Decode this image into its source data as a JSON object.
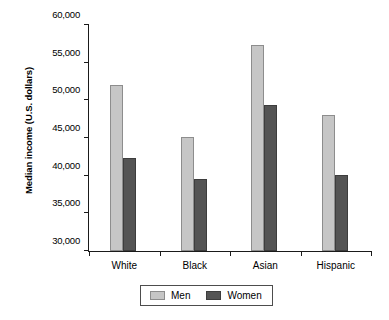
{
  "chart_data": {
    "type": "bar",
    "title": "",
    "xlabel": "",
    "ylabel": "Median income (U.S. dollars)",
    "categories": [
      "White",
      "Black",
      "Asian",
      "Hispanic"
    ],
    "series": [
      {
        "name": "Men",
        "color": "#c6c6c6",
        "values": [
          52100,
          45200,
          57400,
          48100
        ]
      },
      {
        "name": "Women",
        "color": "#545454",
        "values": [
          42400,
          39500,
          49400,
          40100
        ]
      }
    ],
    "ylim": [
      30000,
      60000
    ],
    "ytick_step": 5000,
    "ytick_labels": [
      "30,000",
      "35,000",
      "40,000",
      "45,000",
      "50,000",
      "55,000",
      "60,000"
    ],
    "ytick_values": [
      30000,
      35000,
      40000,
      45000,
      50000,
      55000,
      60000
    ],
    "grid": false,
    "legend_position": "bottom"
  },
  "colors": {
    "men": "#c6c6c6",
    "women": "#545454",
    "axis": "#1a1a1a",
    "background": "#ffffff"
  }
}
